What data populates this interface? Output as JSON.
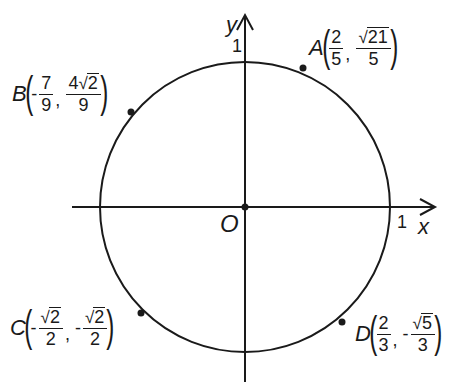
{
  "diagram": {
    "type": "unit-circle",
    "axes": {
      "x_label": "x",
      "y_label": "y",
      "origin_label": "O",
      "x_tick": "1",
      "y_tick": "1"
    },
    "points": [
      {
        "name": "A",
        "x": {
          "sign": "",
          "num": "2",
          "den": "5",
          "sqrt": false
        },
        "y": {
          "sign": "",
          "coef": "",
          "num": "21",
          "den": "5",
          "sqrt": true
        }
      },
      {
        "name": "B",
        "x": {
          "sign": "-",
          "num": "7",
          "den": "9",
          "sqrt": false
        },
        "y": {
          "sign": "",
          "coef": "4",
          "num": "2",
          "den": "9",
          "sqrt": true
        }
      },
      {
        "name": "C",
        "x": {
          "sign": "-",
          "coef": "",
          "num": "2",
          "den": "2",
          "sqrt": true
        },
        "y": {
          "sign": "-",
          "coef": "",
          "num": "2",
          "den": "2",
          "sqrt": true
        }
      },
      {
        "name": "D",
        "x": {
          "sign": "",
          "num": "2",
          "den": "3",
          "sqrt": false
        },
        "y": {
          "sign": "-",
          "coef": "",
          "num": "5",
          "den": "3",
          "sqrt": true
        }
      }
    ],
    "colors": {
      "stroke": "#1a1a1a",
      "background": "#ffffff"
    }
  }
}
